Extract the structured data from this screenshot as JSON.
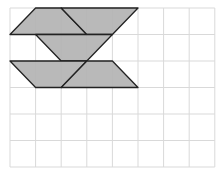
{
  "diagram": {
    "grid": {
      "cols": 8,
      "rows": 6,
      "origin_x": 10,
      "origin_y": 8,
      "cell_w": 25.6,
      "cell_h": 26.5,
      "line_color": "#d9d9d9",
      "border_color": "#cfcfcf"
    },
    "shape_fill": "#b3b3b3",
    "shape_stroke": "#222222",
    "shapes": [
      {
        "name": "parallelogram-top-left",
        "points": [
          [
            0,
            1
          ],
          [
            1,
            0
          ],
          [
            2,
            0
          ],
          [
            3,
            1
          ]
        ]
      },
      {
        "name": "trapezoid-top-right",
        "points": [
          [
            2,
            0
          ],
          [
            5,
            0
          ],
          [
            4,
            1
          ],
          [
            3,
            1
          ]
        ]
      },
      {
        "name": "trapezoid-middle",
        "points": [
          [
            1,
            1
          ],
          [
            4,
            1
          ],
          [
            3,
            2
          ],
          [
            2,
            2
          ]
        ]
      },
      {
        "name": "trapezoid-bottom-left",
        "points": [
          [
            0,
            2
          ],
          [
            3,
            2
          ],
          [
            2,
            3
          ],
          [
            1,
            3
          ]
        ]
      },
      {
        "name": "parallelogram-bottom-right",
        "points": [
          [
            3,
            2
          ],
          [
            4,
            2
          ],
          [
            5,
            3
          ],
          [
            2,
            3
          ]
        ]
      }
    ]
  }
}
